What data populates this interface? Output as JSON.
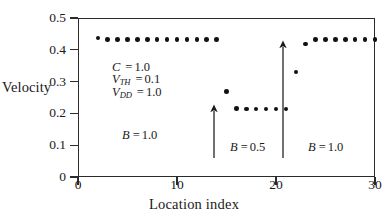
{
  "chart_data": {
    "type": "scatter",
    "title": "",
    "xlabel": "Location index",
    "ylabel": "Velocity",
    "xlim": [
      0,
      30
    ],
    "ylim": [
      0,
      0.5
    ],
    "xticks": [
      0,
      10,
      20,
      30
    ],
    "xticklabels": [
      "0",
      "10",
      "20",
      "30"
    ],
    "yticks": [
      0,
      0.1,
      0.2,
      0.3,
      0.4,
      0.5
    ],
    "yticklabels": [
      "0",
      "0.1",
      "0.2",
      "0.3",
      "0.4",
      "0.5"
    ],
    "grid": false,
    "legend": null,
    "series": [
      {
        "name": "Velocity",
        "x": [
          2,
          3,
          4,
          5,
          6,
          7,
          8,
          9,
          10,
          11,
          12,
          13,
          14,
          15,
          16,
          17,
          18,
          19,
          20,
          21,
          22,
          23,
          24,
          25,
          26,
          27,
          28,
          29,
          30
        ],
        "y": [
          0.437,
          0.432,
          0.432,
          0.432,
          0.432,
          0.432,
          0.432,
          0.432,
          0.432,
          0.432,
          0.432,
          0.432,
          0.432,
          0.268,
          0.216,
          0.214,
          0.214,
          0.214,
          0.214,
          0.214,
          0.33,
          0.418,
          0.432,
          0.432,
          0.432,
          0.432,
          0.432,
          0.432,
          0.432
        ]
      }
    ],
    "annotations": [
      {
        "id": "params-c",
        "name": "C",
        "sub": "",
        "eq": "=",
        "value": "1.0"
      },
      {
        "id": "params-vth",
        "name": "V",
        "sub": "TH",
        "eq": "=",
        "value": "0.1"
      },
      {
        "id": "params-vdd",
        "name": "V",
        "sub": "DD",
        "eq": "=",
        "value": "1.0"
      }
    ],
    "regions": [
      {
        "id": "region-left",
        "name": "B",
        "eq": "=",
        "value": "1.0",
        "span": [
          0,
          13.5
        ]
      },
      {
        "id": "region-middle",
        "name": "B",
        "eq": "=",
        "value": "0.5",
        "span": [
          13.5,
          20.5
        ]
      },
      {
        "id": "region-right",
        "name": "B",
        "eq": "=",
        "value": "1.0",
        "span": [
          20.5,
          30
        ]
      }
    ],
    "arrows": [
      {
        "id": "arrow-left-boundary",
        "x": 13.7,
        "direction": "up"
      },
      {
        "id": "arrow-right-boundary",
        "x": 20.7,
        "direction": "up"
      }
    ]
  },
  "axes": {
    "ylabel": "Velocity",
    "xlabel": "Location index"
  },
  "params": {
    "c_name": "C",
    "c_eq": "=",
    "c_value": "1.0",
    "vth_name": "V",
    "vth_sub": "TH",
    "vth_eq": "=",
    "vth_value": "0.1",
    "vdd_name": "V",
    "vdd_sub": "DD",
    "vdd_eq": "=",
    "vdd_value": "1.0"
  },
  "regions": {
    "left_name": "B",
    "left_eq": "=",
    "left_value": "1.0",
    "mid_name": "B",
    "mid_eq": "=",
    "mid_value": "0.5",
    "right_name": "B",
    "right_eq": "=",
    "right_value": "1.0"
  }
}
